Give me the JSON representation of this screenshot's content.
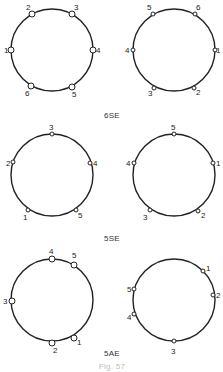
{
  "figure": {
    "caption": "Fig. 57",
    "panels": [
      {
        "label": "6SE",
        "label_pos": [
          112,
          118
        ],
        "rings": [
          {
            "center": [
              52,
              50
            ],
            "radius": 41,
            "nodes": [
              {
                "id": "1",
                "x": 11,
                "y": 50,
                "lx": 4,
                "ly": 53,
                "size": 3
              },
              {
                "id": "2",
                "x": 32,
                "y": 14,
                "lx": 26,
                "ly": 10,
                "size": 3
              },
              {
                "id": "3",
                "x": 72,
                "y": 14,
                "lx": 74,
                "ly": 10,
                "size": 3
              },
              {
                "id": "4",
                "x": 93,
                "y": 50,
                "lx": 96,
                "ly": 53,
                "size": 3
              },
              {
                "id": "5",
                "x": 72,
                "y": 87,
                "lx": 72,
                "ly": 97,
                "size": 3
              },
              {
                "id": "6",
                "x": 31,
                "y": 86,
                "lx": 25,
                "ly": 96,
                "size": 3
              }
            ]
          },
          {
            "center": [
              174,
              50
            ],
            "radius": 41,
            "nodes": [
              {
                "id": "5",
                "x": 153,
                "y": 14,
                "lx": 147,
                "ly": 10,
                "size": 2
              },
              {
                "id": "6",
                "x": 195,
                "y": 14,
                "lx": 196,
                "ly": 10,
                "size": 2
              },
              {
                "id": "4",
                "x": 133,
                "y": 50,
                "lx": 125,
                "ly": 53,
                "size": 2
              },
              {
                "id": "1",
                "x": 215,
                "y": 50,
                "lx": 216,
                "ly": 53,
                "size": 2
              },
              {
                "id": "3",
                "x": 154,
                "y": 88,
                "lx": 148,
                "ly": 96,
                "size": 2
              },
              {
                "id": "2",
                "x": 194,
                "y": 88,
                "lx": 196,
                "ly": 95,
                "size": 2
              }
            ]
          }
        ]
      },
      {
        "label": "5SE",
        "label_pos": [
          112,
          241
        ],
        "rings": [
          {
            "center": [
              52,
              175
            ],
            "radius": 41,
            "nodes": [
              {
                "id": "3",
                "x": 52,
                "y": 134,
                "lx": 49,
                "ly": 130,
                "size": 2
              },
              {
                "id": "4",
                "x": 90,
                "y": 163,
                "lx": 93,
                "ly": 166,
                "size": 2
              },
              {
                "id": "2",
                "x": 13,
                "y": 162,
                "lx": 6,
                "ly": 166,
                "size": 2
              },
              {
                "id": "5",
                "x": 76,
                "y": 210,
                "lx": 78,
                "ly": 218,
                "size": 2
              },
              {
                "id": "1",
                "x": 28,
                "y": 210,
                "lx": 23,
                "ly": 220,
                "size": 2
              }
            ]
          },
          {
            "center": [
              174,
              175
            ],
            "radius": 41,
            "nodes": [
              {
                "id": "5",
                "x": 174,
                "y": 134,
                "lx": 171,
                "ly": 130,
                "size": 2
              },
              {
                "id": "1",
                "x": 213,
                "y": 163,
                "lx": 216,
                "ly": 166,
                "size": 2
              },
              {
                "id": "4",
                "x": 134,
                "y": 163,
                "lx": 126,
                "ly": 166,
                "size": 2
              },
              {
                "id": "2",
                "x": 198,
                "y": 211,
                "lx": 201,
                "ly": 218,
                "size": 2
              },
              {
                "id": "3",
                "x": 150,
                "y": 210,
                "lx": 143,
                "ly": 220,
                "size": 2
              }
            ]
          }
        ]
      },
      {
        "label": "5AE",
        "label_pos": [
          112,
          356
        ],
        "rings": [
          {
            "center": [
              52,
              300
            ],
            "radius": 41,
            "nodes": [
              {
                "id": "4",
                "x": 52,
                "y": 259,
                "lx": 49,
                "ly": 254,
                "size": 3
              },
              {
                "id": "5",
                "x": 74,
                "y": 265,
                "lx": 72,
                "ly": 258,
                "size": 3
              },
              {
                "id": "3",
                "x": 12,
                "y": 301,
                "lx": 3,
                "ly": 304,
                "size": 3
              },
              {
                "id": "1",
                "x": 74,
                "y": 338,
                "lx": 77,
                "ly": 345,
                "size": 3
              },
              {
                "id": "2",
                "x": 52,
                "y": 343,
                "lx": 53,
                "ly": 353,
                "size": 3
              }
            ]
          },
          {
            "center": [
              174,
              300
            ],
            "radius": 41,
            "nodes": [
              {
                "id": "1",
                "x": 203,
                "y": 271,
                "lx": 206,
                "ly": 271,
                "size": 2
              },
              {
                "id": "2",
                "x": 213,
                "y": 295,
                "lx": 216,
                "ly": 298,
                "size": 2
              },
              {
                "id": "5",
                "x": 134,
                "y": 289,
                "lx": 127,
                "ly": 292,
                "size": 2
              },
              {
                "id": "4",
                "x": 134,
                "y": 314,
                "lx": 127,
                "ly": 320,
                "size": 2
              },
              {
                "id": "3",
                "x": 174,
                "y": 341,
                "lx": 171,
                "ly": 354,
                "size": 2
              }
            ]
          }
        ]
      }
    ]
  }
}
